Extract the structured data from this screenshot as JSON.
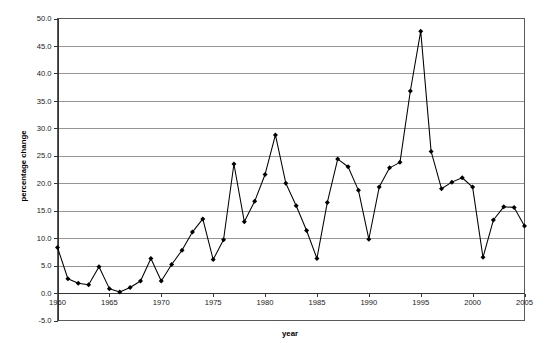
{
  "chart_data": {
    "type": "line",
    "title": "",
    "xlabel": "year",
    "ylabel": "percentage change",
    "xlim": [
      1960,
      2005
    ],
    "ylim": [
      -5.0,
      50.0
    ],
    "grid": true,
    "legend": "none",
    "marker": "filled-diamond",
    "line_color": "#000000",
    "marker_color": "#000000",
    "gridline_color": "#8a8a8a",
    "background_color": "#ffffff",
    "y_ticks": [
      -5.0,
      0.0,
      5.0,
      10.0,
      15.0,
      20.0,
      25.0,
      30.0,
      35.0,
      40.0,
      45.0,
      50.0
    ],
    "y_tick_labels": [
      "-5.0",
      "0.0",
      "5.0",
      "10.0",
      "15.0",
      "20.0",
      "25.0",
      "30.0",
      "35.0",
      "40.0",
      "45.0",
      "50.0"
    ],
    "x_ticks": [
      1960,
      1965,
      1970,
      1975,
      1980,
      1985,
      1990,
      1995,
      2000,
      2005
    ],
    "x_tick_labels": [
      "1960",
      "1965",
      "1970",
      "1975",
      "1980",
      "1985",
      "1990",
      "1995",
      "2000",
      "2005"
    ],
    "x": [
      1960,
      1961,
      1962,
      1963,
      1964,
      1965,
      1966,
      1967,
      1968,
      1969,
      1970,
      1971,
      1972,
      1973,
      1974,
      1975,
      1976,
      1977,
      1978,
      1979,
      1980,
      1981,
      1982,
      1983,
      1984,
      1985,
      1986,
      1987,
      1988,
      1989,
      1990,
      1991,
      1992,
      1993,
      1994,
      1995,
      1996,
      1997,
      1998,
      1999,
      2000,
      2001,
      2002,
      2003,
      2004,
      2005
    ],
    "values": [
      8.3,
      2.6,
      1.8,
      1.5,
      4.8,
      0.8,
      0.2,
      1.0,
      2.2,
      6.3,
      2.2,
      5.2,
      7.8,
      11.1,
      13.5,
      6.1,
      9.7,
      23.5,
      13.0,
      16.7,
      21.6,
      28.8,
      20.0,
      15.9,
      11.4,
      6.3,
      16.5,
      24.4,
      23.0,
      18.7,
      9.8,
      19.3,
      22.8,
      23.8,
      36.8,
      47.7,
      25.8,
      19.0,
      20.2,
      21.0,
      19.3,
      6.5,
      13.3,
      15.7,
      15.6,
      12.2
    ]
  }
}
